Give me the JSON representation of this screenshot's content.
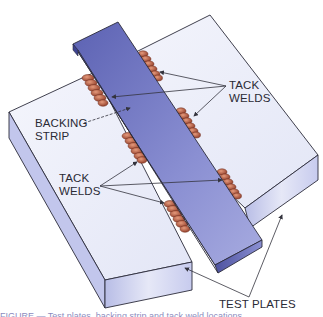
{
  "figure": {
    "labels": {
      "tack_welds_top": [
        "TACK",
        "WELDS"
      ],
      "backing_strip": [
        "BACKING",
        "STRIP"
      ],
      "tack_welds_left": [
        "TACK",
        "WELDS"
      ],
      "test_plates": "TEST PLATES"
    },
    "caption_partial": "FIGURE  —  Test plates, backing strip and tack weld locations",
    "colors": {
      "plate_top": "#eef0fa",
      "plate_side": "#c4c8ea",
      "strip_top": "#7b80c6",
      "strip_side": "#5a5fae",
      "weld": "#b4563c",
      "outline": "#2b2b3a",
      "leader": "#33333d"
    }
  }
}
